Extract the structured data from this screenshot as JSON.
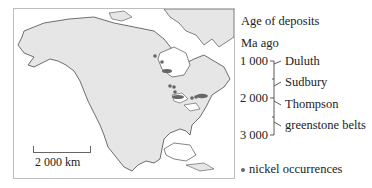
{
  "map": {
    "scale_bar_label": "2 000 km",
    "land_color": "#e6e6e6",
    "coast_color": "#333333",
    "deposit_color": "#666666"
  },
  "legend": {
    "title": "Age of deposits",
    "unit_label": "Ma ago",
    "ticks": [
      "1 000",
      "2 000",
      "3 000"
    ],
    "deposits": [
      {
        "name": "Duluth"
      },
      {
        "name": "Sudbury"
      },
      {
        "name": "Thompson"
      },
      {
        "name": "greenstone belts"
      }
    ],
    "nickel_label": "nickel occurrences"
  }
}
